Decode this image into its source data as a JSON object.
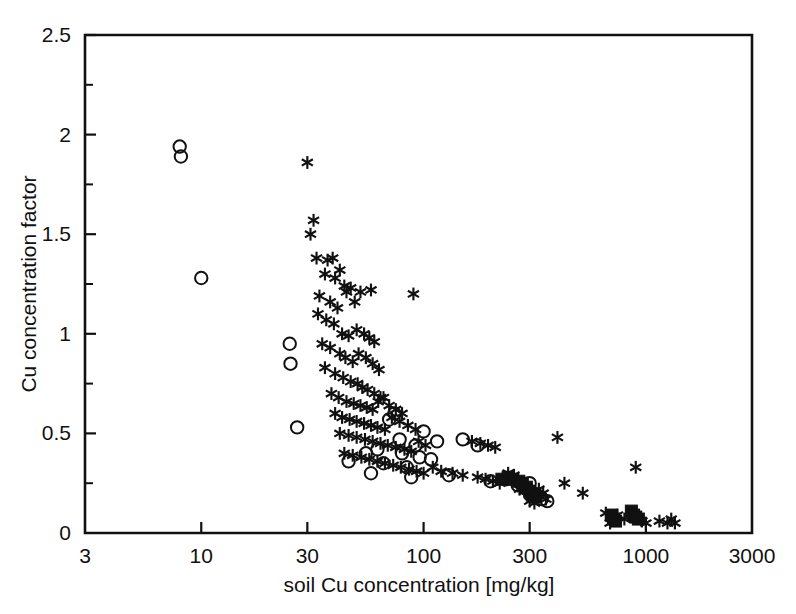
{
  "chart_data": {
    "type": "scatter",
    "title": "",
    "xlabel": "soil Cu concentration [mg/kg]",
    "ylabel": "Cu concentration factor",
    "xscale": "log",
    "yscale": "linear",
    "xlim": [
      3,
      3000
    ],
    "ylim": [
      0,
      2.5
    ],
    "xticks": [
      3,
      10,
      30,
      100,
      300,
      1000,
      3000
    ],
    "xtick_labels": [
      "3",
      "10",
      "30",
      "100",
      "300",
      "1000",
      "3000"
    ],
    "yticks": [
      0,
      0.5,
      1,
      1.5,
      2,
      2.5
    ],
    "ytick_labels": [
      "0",
      "0.5",
      "1",
      "1.5",
      "2",
      "2.5"
    ],
    "yticks_minor": [
      0.25,
      0.75,
      1.25,
      1.75,
      2.25
    ],
    "grid": false,
    "legend": "none",
    "series": [
      {
        "name": "open-circle",
        "marker": "circle-open",
        "color": "#111111",
        "points": [
          [
            8.0,
            1.94
          ],
          [
            8.1,
            1.89
          ],
          [
            10.0,
            1.28
          ],
          [
            25.0,
            0.95
          ],
          [
            25.2,
            0.85
          ],
          [
            27.0,
            0.53
          ],
          [
            46.0,
            0.36
          ],
          [
            55.0,
            0.4
          ],
          [
            58.0,
            0.3
          ],
          [
            62.0,
            0.42
          ],
          [
            66.0,
            0.35
          ],
          [
            70.0,
            0.57
          ],
          [
            74.0,
            0.6
          ],
          [
            78.0,
            0.47
          ],
          [
            80.0,
            0.4
          ],
          [
            84.0,
            0.33
          ],
          [
            88.0,
            0.28
          ],
          [
            92.0,
            0.44
          ],
          [
            96.0,
            0.38
          ],
          [
            100.0,
            0.51
          ],
          [
            108.0,
            0.37
          ],
          [
            115.0,
            0.46
          ],
          [
            130.0,
            0.29
          ],
          [
            150.0,
            0.47
          ],
          [
            175.0,
            0.44
          ],
          [
            200.0,
            0.26
          ],
          [
            235.0,
            0.27
          ],
          [
            265.0,
            0.24
          ],
          [
            290.0,
            0.22
          ],
          [
            300.0,
            0.25
          ],
          [
            320.0,
            0.19
          ],
          [
            340.0,
            0.17
          ],
          [
            360.0,
            0.16
          ]
        ]
      },
      {
        "name": "filled-square",
        "marker": "square-filled",
        "color": "#111111",
        "points": [
          [
            225.0,
            0.27
          ],
          [
            240.0,
            0.28
          ],
          [
            252.0,
            0.27
          ],
          [
            268.0,
            0.26
          ],
          [
            278.0,
            0.25
          ],
          [
            290.0,
            0.23
          ],
          [
            300.0,
            0.21
          ],
          [
            308.0,
            0.19
          ],
          [
            318.0,
            0.18
          ],
          [
            700.0,
            0.09
          ],
          [
            715.0,
            0.07
          ],
          [
            730.0,
            0.06
          ],
          [
            860.0,
            0.11
          ],
          [
            880.0,
            0.09
          ],
          [
            900.0,
            0.08
          ],
          [
            925.0,
            0.07
          ]
        ]
      },
      {
        "name": "asterisk",
        "marker": "asterisk",
        "color": "#111111",
        "points": [
          [
            30.0,
            1.86
          ],
          [
            32.0,
            1.57
          ],
          [
            31.0,
            1.5
          ],
          [
            33.0,
            1.38
          ],
          [
            37.0,
            1.37
          ],
          [
            39.0,
            1.38
          ],
          [
            42.0,
            1.32
          ],
          [
            36.0,
            1.3
          ],
          [
            40.0,
            1.28
          ],
          [
            44.0,
            1.24
          ],
          [
            47.0,
            1.23
          ],
          [
            52.0,
            1.21
          ],
          [
            58.0,
            1.22
          ],
          [
            34.0,
            1.19
          ],
          [
            38.0,
            1.16
          ],
          [
            41.0,
            1.13
          ],
          [
            45.0,
            1.21
          ],
          [
            49.0,
            1.16
          ],
          [
            90.0,
            1.2
          ],
          [
            33.5,
            1.1
          ],
          [
            36.5,
            1.07
          ],
          [
            39.5,
            1.05
          ],
          [
            43.0,
            1.0
          ],
          [
            46.0,
            0.99
          ],
          [
            50.0,
            1.02
          ],
          [
            54.0,
            1.0
          ],
          [
            57.0,
            0.98
          ],
          [
            60.0,
            0.96
          ],
          [
            35.0,
            0.95
          ],
          [
            38.0,
            0.93
          ],
          [
            42.0,
            0.9
          ],
          [
            44.5,
            0.88
          ],
          [
            48.0,
            0.86
          ],
          [
            51.0,
            0.9
          ],
          [
            55.0,
            0.88
          ],
          [
            59.0,
            0.85
          ],
          [
            63.0,
            0.82
          ],
          [
            36.0,
            0.83
          ],
          [
            40.0,
            0.8
          ],
          [
            43.5,
            0.78
          ],
          [
            47.0,
            0.76
          ],
          [
            50.5,
            0.75
          ],
          [
            53.0,
            0.73
          ],
          [
            56.0,
            0.72
          ],
          [
            60.0,
            0.7
          ],
          [
            64.0,
            0.68
          ],
          [
            38.5,
            0.7
          ],
          [
            41.5,
            0.68
          ],
          [
            45.0,
            0.66
          ],
          [
            48.5,
            0.65
          ],
          [
            52.0,
            0.64
          ],
          [
            55.5,
            0.63
          ],
          [
            59.0,
            0.62
          ],
          [
            62.5,
            0.66
          ],
          [
            66.0,
            0.68
          ],
          [
            70.0,
            0.64
          ],
          [
            75.0,
            0.62
          ],
          [
            80.0,
            0.6
          ],
          [
            40.0,
            0.6
          ],
          [
            43.0,
            0.58
          ],
          [
            46.5,
            0.57
          ],
          [
            50.0,
            0.56
          ],
          [
            54.0,
            0.55
          ],
          [
            58.0,
            0.54
          ],
          [
            62.0,
            0.53
          ],
          [
            67.0,
            0.52
          ],
          [
            72.0,
            0.58
          ],
          [
            78.0,
            0.56
          ],
          [
            85.0,
            0.54
          ],
          [
            92.0,
            0.52
          ],
          [
            42.0,
            0.5
          ],
          [
            46.0,
            0.49
          ],
          [
            50.0,
            0.48
          ],
          [
            54.5,
            0.47
          ],
          [
            59.0,
            0.46
          ],
          [
            64.0,
            0.45
          ],
          [
            69.0,
            0.44
          ],
          [
            75.0,
            0.43
          ],
          [
            82.0,
            0.42
          ],
          [
            88.0,
            0.41
          ],
          [
            95.0,
            0.46
          ],
          [
            102.0,
            0.44
          ],
          [
            44.0,
            0.4
          ],
          [
            48.0,
            0.39
          ],
          [
            52.5,
            0.38
          ],
          [
            57.0,
            0.37
          ],
          [
            62.0,
            0.36
          ],
          [
            67.0,
            0.35
          ],
          [
            73.0,
            0.34
          ],
          [
            79.0,
            0.33
          ],
          [
            86.0,
            0.32
          ],
          [
            93.0,
            0.31
          ],
          [
            100.0,
            0.3
          ],
          [
            110.0,
            0.33
          ],
          [
            120.0,
            0.31
          ],
          [
            135.0,
            0.3
          ],
          [
            150.0,
            0.29
          ],
          [
            165.0,
            0.46
          ],
          [
            180.0,
            0.45
          ],
          [
            195.0,
            0.44
          ],
          [
            210.0,
            0.43
          ],
          [
            175.0,
            0.28
          ],
          [
            190.0,
            0.27
          ],
          [
            205.0,
            0.26
          ],
          [
            220.0,
            0.25
          ],
          [
            240.0,
            0.3
          ],
          [
            255.0,
            0.29
          ],
          [
            270.0,
            0.22
          ],
          [
            285.0,
            0.21
          ],
          [
            300.0,
            0.16
          ],
          [
            315.0,
            0.15
          ],
          [
            330.0,
            0.22
          ],
          [
            345.0,
            0.2
          ],
          [
            355.0,
            0.17
          ],
          [
            400.0,
            0.48
          ],
          [
            430.0,
            0.25
          ],
          [
            520.0,
            0.2
          ],
          [
            660.0,
            0.1
          ],
          [
            690.0,
            0.05
          ],
          [
            745.0,
            0.09
          ],
          [
            800.0,
            0.07
          ],
          [
            900.0,
            0.33
          ],
          [
            960.0,
            0.06
          ],
          [
            1000.0,
            0.05
          ],
          [
            1150.0,
            0.06
          ],
          [
            1250.0,
            0.05
          ],
          [
            1300.0,
            0.07
          ],
          [
            1350.0,
            0.05
          ]
        ]
      }
    ]
  },
  "axes": {
    "x_label": "soil Cu concentration [mg/kg]",
    "y_label": "Cu concentration factor"
  }
}
